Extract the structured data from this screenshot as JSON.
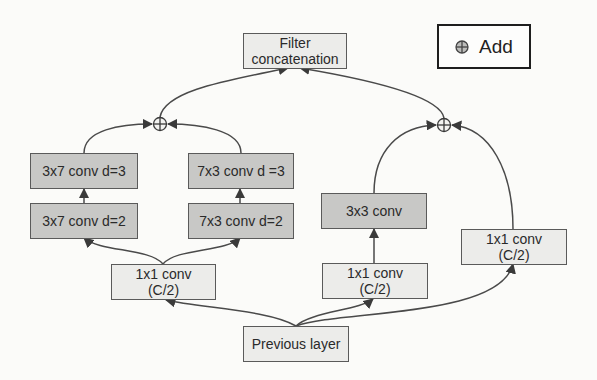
{
  "legend": {
    "icon": "circled-plus-icon",
    "label": "Add"
  },
  "nodes": {
    "filter_concat": {
      "line1": "Filter",
      "line2": "concatenation"
    },
    "conv3x7_d3": {
      "label": "3x7 conv d=3"
    },
    "conv3x7_d2": {
      "label": "3x7 conv d=2"
    },
    "conv7x3_d3": {
      "label": "7x3 conv d =3"
    },
    "conv7x3_d2": {
      "label": "7x3 conv d=2"
    },
    "conv1x1_left": {
      "line1": "1x1 conv",
      "line2": "(C/2)"
    },
    "conv3x3": {
      "label": "3x3 conv"
    },
    "conv1x1_mid": {
      "line1": "1x1 conv",
      "line2": "(C/2)"
    },
    "conv1x1_right": {
      "line1": "1x1 conv",
      "line2": "(C/2)"
    },
    "previous_layer": {
      "label": "Previous layer"
    }
  },
  "colors": {
    "dark_box": "#c8c8c6",
    "light_box": "#ececea",
    "edge": "#4a4a4a"
  }
}
